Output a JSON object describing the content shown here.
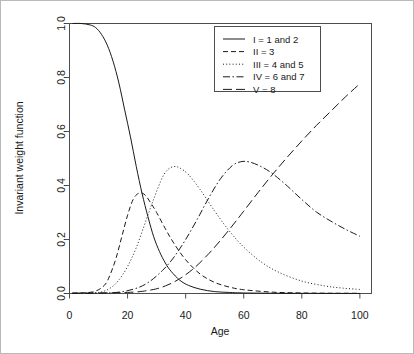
{
  "chart_data": {
    "type": "line",
    "title": "",
    "xlabel": "Age",
    "ylabel": "Invariant weight function",
    "xlim": [
      0,
      104
    ],
    "ylim": [
      0,
      1.0
    ],
    "xticks": [
      0,
      20,
      40,
      60,
      80,
      100
    ],
    "xtick_labels": [
      "0",
      "20",
      "40",
      "60",
      "80",
      "100"
    ],
    "yticks": [
      0.0,
      0.2,
      0.4,
      0.6,
      0.8,
      1.0
    ],
    "ytick_labels": [
      "0.0",
      "0.2",
      "0.4",
      "0.6",
      "0.8",
      "1.0"
    ],
    "grid": false,
    "legend_position": "top-right",
    "line_color": "#1a1a1a",
    "frame_color": "#4d4d4d",
    "series": [
      {
        "name": "I = 1 and 2",
        "style": "solid",
        "dash": "none",
        "x": [
          1,
          4,
          7,
          9,
          11,
          13,
          15,
          17,
          19,
          21,
          23,
          25,
          27,
          29,
          31,
          33,
          35,
          38,
          41,
          45,
          50,
          55,
          60,
          70,
          80,
          90,
          100
        ],
        "values": [
          1.0,
          1.0,
          0.995,
          0.985,
          0.96,
          0.92,
          0.86,
          0.78,
          0.68,
          0.58,
          0.47,
          0.37,
          0.285,
          0.21,
          0.155,
          0.113,
          0.082,
          0.049,
          0.03,
          0.016,
          0.007,
          0.004,
          0.002,
          0.001,
          0.0005,
          0.0003,
          0.0002
        ]
      },
      {
        "name": "II = 3",
        "style": "dashed",
        "dash": "5,3",
        "x": [
          1,
          8,
          12,
          14,
          16,
          18,
          20,
          22,
          24,
          26,
          28,
          30,
          33,
          36,
          40,
          45,
          50,
          55,
          60,
          70,
          80,
          90,
          100
        ],
        "values": [
          0.002,
          0.006,
          0.03,
          0.07,
          0.13,
          0.21,
          0.29,
          0.35,
          0.372,
          0.365,
          0.335,
          0.3,
          0.24,
          0.185,
          0.125,
          0.072,
          0.041,
          0.024,
          0.014,
          0.005,
          0.002,
          0.001,
          0.0007
        ]
      },
      {
        "name": "III = 4 and 5",
        "style": "dotted",
        "dash": "1,2.2",
        "x": [
          1,
          10,
          14,
          17,
          20,
          23,
          26,
          29,
          32,
          34,
          36,
          38,
          41,
          45,
          50,
          55,
          60,
          66,
          72,
          80,
          88,
          94,
          100
        ],
        "values": [
          0.0005,
          0.004,
          0.02,
          0.05,
          0.1,
          0.17,
          0.26,
          0.35,
          0.43,
          0.46,
          0.47,
          0.465,
          0.44,
          0.385,
          0.305,
          0.232,
          0.172,
          0.117,
          0.079,
          0.046,
          0.028,
          0.02,
          0.015
        ]
      },
      {
        "name": "IV = 6 and 7",
        "style": "dashdot",
        "dash": "7,2.5,1.5,2.5",
        "x": [
          1,
          15,
          22,
          27,
          32,
          36,
          40,
          44,
          48,
          52,
          56,
          59,
          62,
          66,
          70,
          75,
          80,
          85,
          90,
          95,
          100
        ],
        "values": [
          0.0002,
          0.003,
          0.016,
          0.04,
          0.085,
          0.135,
          0.2,
          0.275,
          0.355,
          0.425,
          0.473,
          0.488,
          0.487,
          0.47,
          0.443,
          0.398,
          0.348,
          0.302,
          0.268,
          0.238,
          0.212
        ]
      },
      {
        "name": "V = 8",
        "style": "longdash",
        "dash": "9,4",
        "x": [
          1,
          20,
          28,
          33,
          38,
          43,
          48,
          52,
          56,
          60,
          65,
          70,
          75,
          80,
          85,
          90,
          95,
          100
        ],
        "values": [
          0.001,
          0.004,
          0.013,
          0.028,
          0.055,
          0.095,
          0.148,
          0.197,
          0.25,
          0.305,
          0.375,
          0.442,
          0.505,
          0.565,
          0.622,
          0.675,
          0.728,
          0.777
        ]
      }
    ]
  },
  "legend": {
    "items": [
      {
        "label": "I = 1 and 2"
      },
      {
        "label": "II = 3"
      },
      {
        "label": "III = 4 and 5"
      },
      {
        "label": "IV = 6 and 7"
      },
      {
        "label": "V = 8"
      }
    ]
  }
}
